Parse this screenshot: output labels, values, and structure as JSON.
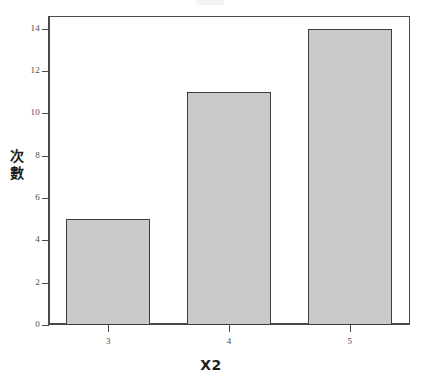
{
  "chart_data": {
    "type": "bar",
    "title": "",
    "xlabel": "X2",
    "ylabel": "次數",
    "categories": [
      "3",
      "4",
      "5"
    ],
    "values": [
      5,
      11,
      14
    ],
    "series": [
      {
        "name": "次數",
        "values": [
          5,
          11,
          14
        ]
      }
    ],
    "ylim": [
      0,
      14.6
    ],
    "y_ticks": [
      0,
      2,
      4,
      6,
      8,
      10,
      12,
      14
    ],
    "y_tick_labels": [
      "0",
      "2",
      "4",
      "6",
      "8",
      "10",
      "12",
      "14"
    ],
    "x_tick_labels": [
      "3",
      "4",
      "5"
    ],
    "grid": false,
    "legend": null,
    "bar_fill_color": "#c9c9c9",
    "bar_border_color": "#3d3d3d",
    "axis_color": "#4a4a4a",
    "background_color": "#ffffff"
  },
  "labels": {
    "y_axis_title_chars": [
      "次",
      "數"
    ],
    "x_axis_title": "X2"
  }
}
